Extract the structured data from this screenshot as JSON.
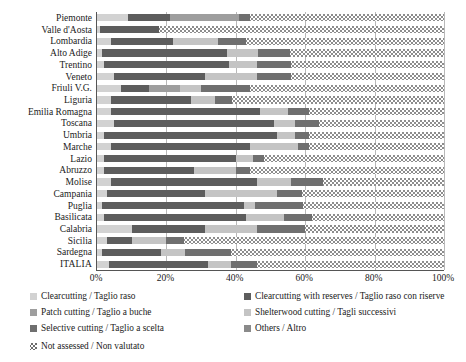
{
  "chart_data": {
    "type": "bar",
    "orientation": "horizontal",
    "stacked": true,
    "normalized": true,
    "title": "",
    "xlabel": "",
    "ylabel": "",
    "xlim": [
      0,
      100
    ],
    "xticks": [
      "0%",
      "20%",
      "40%",
      "60%",
      "80%",
      "100%"
    ],
    "xtick_values": [
      0,
      20,
      40,
      60,
      80,
      100
    ],
    "grid": true,
    "legend_position": "bottom",
    "categories": [
      "Piemonte",
      "Valle d'Aosta",
      "Lombardia",
      "Alto Adige",
      "Trentino",
      "Veneto",
      "Friuli V.G.",
      "Liguria",
      "Emilia Romagna",
      "Toscana",
      "Umbria",
      "Marche",
      "Lazio",
      "Abruzzo",
      "Molise",
      "Campania",
      "Puglia",
      "Basilicata",
      "Calabria",
      "Sicilia",
      "Sardegna",
      "ITALIA"
    ],
    "series": [
      {
        "name": "Clearcutting / Taglio raso",
        "key": "clearcutting",
        "color": "#d2d2d2",
        "values": [
          9.0,
          1.0,
          4.0,
          1.5,
          2.0,
          5.0,
          7.0,
          4.0,
          4.0,
          5.0,
          2.0,
          4.0,
          2.0,
          2.0,
          4.0,
          3.0,
          1.5,
          2.0,
          10.0,
          3.0,
          1.5,
          3.5
        ]
      },
      {
        "name": "Clearcutting with reserves / Taglio raso con riserve",
        "key": "clearcutting_reserves",
        "color": "#5d5d5d",
        "values": [
          12.0,
          17.0,
          18.0,
          36.0,
          36.0,
          26.0,
          8.0,
          23.0,
          43.0,
          46.0,
          50.0,
          40.0,
          38.0,
          26.0,
          42.0,
          28.0,
          41.0,
          41.0,
          21.0,
          7.0,
          17.0,
          28.5
        ]
      },
      {
        "name": "Patch cutting / Taglio a buche",
        "key": "patch_cutting",
        "color": "#9e9e9e",
        "values": [
          20.0,
          0.0,
          0.0,
          0.0,
          0.0,
          0.0,
          9.0,
          0.0,
          0.0,
          0.0,
          0.0,
          0.0,
          0.0,
          0.0,
          0.0,
          0.0,
          0.0,
          0.0,
          0.0,
          0.0,
          0.0,
          0.0
        ]
      },
      {
        "name": "Shelterwood cutting / Tagli successivi",
        "key": "shelterwood",
        "color": "#c4c4c4",
        "values": [
          0.0,
          0.0,
          13.0,
          9.0,
          8.0,
          15.0,
          6.0,
          7.0,
          8.0,
          6.0,
          5.0,
          14.0,
          5.0,
          12.0,
          10.0,
          21.0,
          3.0,
          11.0,
          15.0,
          10.0,
          7.0,
          6.5
        ]
      },
      {
        "name": "Selective cutting / Taglio a scelta",
        "key": "selective_cutting",
        "color": "#6f6f6f",
        "values": [
          3.0,
          0.0,
          8.0,
          9.0,
          10.0,
          10.0,
          14.0,
          5.0,
          6.0,
          7.0,
          4.0,
          3.0,
          3.0,
          4.0,
          9.0,
          7.0,
          14.0,
          8.0,
          14.0,
          5.0,
          13.0,
          7.5
        ]
      },
      {
        "name": "Others / Altro",
        "key": "others",
        "color": "#8a8a8a",
        "values": [
          0.0,
          0.0,
          0.0,
          0.0,
          0.0,
          0.0,
          0.0,
          0.0,
          0.0,
          0.0,
          0.0,
          0.0,
          0.0,
          0.0,
          0.0,
          0.0,
          0.0,
          0.0,
          0.0,
          0.0,
          0.0,
          0.0
        ]
      },
      {
        "name": "Not assessed / Non valutato",
        "key": "not_assessed",
        "color": "#ffffff",
        "hatch": true,
        "values": [
          56.0,
          82.0,
          57.0,
          44.5,
          44.0,
          44.0,
          56.0,
          61.0,
          39.0,
          36.0,
          39.0,
          39.0,
          52.0,
          56.0,
          35.0,
          41.0,
          40.5,
          38.0,
          40.0,
          75.0,
          61.5,
          54.0
        ]
      }
    ]
  },
  "legend": {
    "items": [
      {
        "label": "Clearcutting / Taglio raso",
        "swatch": "c0"
      },
      {
        "label": "Clearcutting with reserves / Taglio raso con riserve",
        "swatch": "c1"
      },
      {
        "label": "Patch cutting / Taglio a buche",
        "swatch": "c2"
      },
      {
        "label": "Shelterwood cutting / Tagli successivi",
        "swatch": "c3"
      },
      {
        "label": "Selective cutting / Taglio a scelta",
        "swatch": "c4"
      },
      {
        "label": "Others / Altro",
        "swatch": "c5"
      },
      {
        "label": "Not assessed / Non valutato",
        "swatch": "c6"
      }
    ]
  }
}
